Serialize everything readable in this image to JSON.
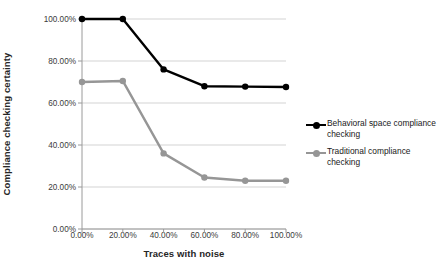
{
  "chart_data": {
    "type": "line",
    "title": "",
    "xlabel": "Traces with noise",
    "ylabel": "Compliance checking certainty",
    "x": [
      0,
      20,
      40,
      60,
      80,
      100
    ],
    "x_tick_labels": [
      "0.00%",
      "20.00%",
      "40.00%",
      "60.00%",
      "80.00%",
      "100.00%"
    ],
    "y_tick_labels": [
      "0.00%",
      "20.00%",
      "40.00%",
      "60.00%",
      "80.00%",
      "100.00%"
    ],
    "y_ticks": [
      0,
      20,
      40,
      60,
      80,
      100
    ],
    "ylim": [
      0,
      100
    ],
    "xlim": [
      0,
      100
    ],
    "grid": "horizontal",
    "legend_position": "right",
    "series": [
      {
        "name": "Behavioral space compliance checking",
        "color": "#000000",
        "marker": "circle",
        "values": [
          100,
          100,
          76,
          68,
          67.8,
          67.6
        ]
      },
      {
        "name": "Traditional compliance checking",
        "color": "#969696",
        "marker": "circle",
        "values": [
          70,
          70.5,
          36,
          24.5,
          23,
          23
        ]
      }
    ]
  },
  "axes": {
    "y_title": "Compliance checking certainty",
    "x_title": "Traces with noise"
  },
  "legend": {
    "items": [
      {
        "label": "Behavioral space compliance checking",
        "color": "#000000"
      },
      {
        "label": "Traditional compliance checking",
        "color": "#969696"
      }
    ]
  }
}
